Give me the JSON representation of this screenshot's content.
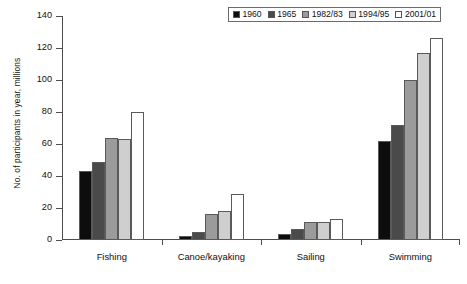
{
  "chart_data": {
    "type": "bar",
    "title": "",
    "xlabel": "",
    "ylabel": "No. of participants in year, millions",
    "ylim": [
      0,
      140
    ],
    "ytick_labels": [
      "0",
      "20",
      "40",
      "60",
      "80",
      "100",
      "120",
      "140"
    ],
    "ytick_values": [
      0,
      20,
      40,
      60,
      80,
      100,
      120,
      140
    ],
    "grid": false,
    "legend_position": "top-right",
    "categories": [
      "Fishing",
      "Canoe/kayaking",
      "Sailing",
      "Swimming"
    ],
    "series": [
      {
        "name": "1960",
        "color": "#0d0d0d",
        "values": [
          43,
          2.5,
          4,
          62
        ]
      },
      {
        "name": "1965",
        "color": "#4a4a4a",
        "values": [
          49,
          5,
          7,
          72
        ]
      },
      {
        "name": "1982/83",
        "color": "#9b9b9b",
        "values": [
          64,
          16,
          11.5,
          100
        ]
      },
      {
        "name": "1994/95",
        "color": "#cfcfcf",
        "values": [
          63,
          18,
          11,
          117
        ]
      },
      {
        "name": "2001/01",
        "color": "#ffffff",
        "values": [
          80,
          29,
          13,
          126
        ]
      }
    ]
  },
  "caption": {
    "text": ""
  }
}
